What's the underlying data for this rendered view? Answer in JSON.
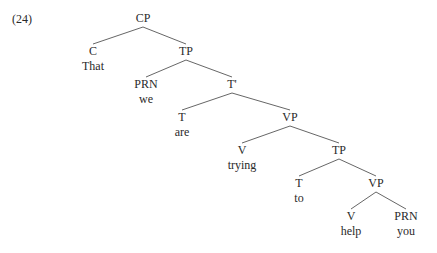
{
  "example_number": "(24)",
  "edge_color": "#555555",
  "nodes": [
    {
      "id": "cp",
      "cat": "CP",
      "word": null,
      "x": 143,
      "y": 12
    },
    {
      "id": "c",
      "cat": "C",
      "word": "That",
      "x": 93,
      "y": 45
    },
    {
      "id": "tp1",
      "cat": "TP",
      "word": null,
      "x": 186,
      "y": 45
    },
    {
      "id": "prn1",
      "cat": "PRN",
      "word": "we",
      "x": 146,
      "y": 78
    },
    {
      "id": "tbar",
      "cat": "T'",
      "word": null,
      "x": 232,
      "y": 78
    },
    {
      "id": "t1",
      "cat": "T",
      "word": "are",
      "x": 182,
      "y": 111
    },
    {
      "id": "vp1",
      "cat": "VP",
      "word": null,
      "x": 290,
      "y": 111
    },
    {
      "id": "v1",
      "cat": "V",
      "word": "trying",
      "x": 242,
      "y": 144
    },
    {
      "id": "tp2",
      "cat": "TP",
      "word": null,
      "x": 339,
      "y": 144
    },
    {
      "id": "t2",
      "cat": "T",
      "word": "to",
      "x": 299,
      "y": 177
    },
    {
      "id": "vp2",
      "cat": "VP",
      "word": null,
      "x": 376,
      "y": 177
    },
    {
      "id": "v2",
      "cat": "V",
      "word": "help",
      "x": 351,
      "y": 210
    },
    {
      "id": "prn2",
      "cat": "PRN",
      "word": "you",
      "x": 406,
      "y": 210
    }
  ],
  "edges": [
    [
      "cp",
      "c"
    ],
    [
      "cp",
      "tp1"
    ],
    [
      "tp1",
      "prn1"
    ],
    [
      "tp1",
      "tbar"
    ],
    [
      "tbar",
      "t1"
    ],
    [
      "tbar",
      "vp1"
    ],
    [
      "vp1",
      "v1"
    ],
    [
      "vp1",
      "tp2"
    ],
    [
      "tp2",
      "t2"
    ],
    [
      "tp2",
      "vp2"
    ],
    [
      "vp2",
      "v2"
    ],
    [
      "vp2",
      "prn2"
    ]
  ]
}
